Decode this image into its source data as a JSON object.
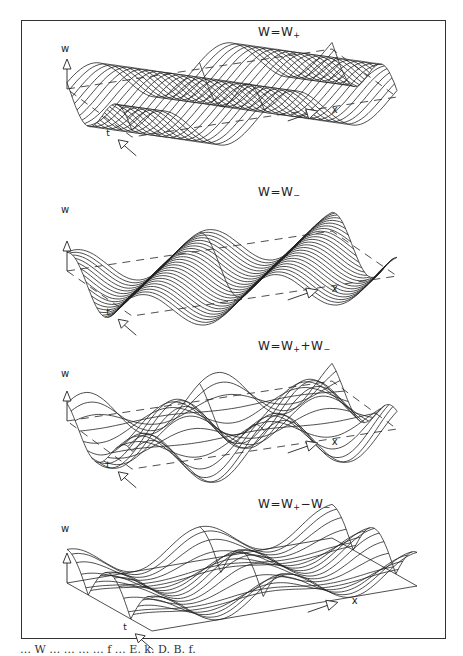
{
  "figure": {
    "panels": [
      {
        "id": "w-plus",
        "equation": {
          "lhs": "W",
          "eq": "=",
          "terms": [
            {
              "base": "W",
              "sub": "+"
            }
          ]
        },
        "vertical_axis_label": "w",
        "horizontal_axis_label": "x",
        "depth_axis_label": "t",
        "surface": "traveling wave moving in +x direction",
        "line_style": "dense diagonal cross-sections"
      },
      {
        "id": "w-minus",
        "equation": {
          "lhs": "W",
          "eq": "=",
          "terms": [
            {
              "base": "W",
              "sub": "−"
            }
          ]
        },
        "vertical_axis_label": "w",
        "horizontal_axis_label": "x",
        "depth_axis_label": "t",
        "surface": "traveling wave moving in −x direction",
        "line_style": "diagonal cross-sections"
      },
      {
        "id": "w-sum",
        "equation": {
          "lhs": "W",
          "eq": "=",
          "terms": [
            {
              "base": "W",
              "sub": "+"
            },
            {
              "op": "+"
            },
            {
              "base": "W",
              "sub": "−"
            }
          ]
        },
        "vertical_axis_label": "w",
        "horizontal_axis_label": "x",
        "depth_axis_label": "t",
        "surface": "superposition W+ + W−",
        "line_style": "cross-sections"
      },
      {
        "id": "w-diff",
        "equation": {
          "lhs": "W",
          "eq": "=",
          "terms": [
            {
              "base": "W",
              "sub": "+"
            },
            {
              "op": "−"
            },
            {
              "base": "W",
              "sub": "−"
            }
          ]
        },
        "vertical_axis_label": "w",
        "horizontal_axis_label": "x",
        "depth_axis_label": "t",
        "surface": "difference W+ − W− (standing wave)",
        "line_style": "cross-sections"
      }
    ],
    "equation_labels": [
      "W = W+",
      "W = W−",
      "W = W+ + W−",
      "W = W+ − W−"
    ],
    "caption_partial": "… W … … … … f … E. k. D. B. f."
  }
}
